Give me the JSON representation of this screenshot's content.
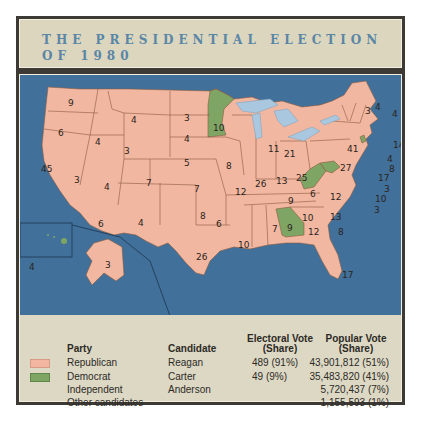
{
  "title": {
    "line1": "THE PRESIDENTIAL ELECTION",
    "line2": "OF 1980"
  },
  "colors": {
    "republican": "#f2b7a0",
    "democrat": "#7fa565",
    "ocean": "#41709a",
    "lakes": "#a9c7de",
    "title_text": "#5a86a6"
  },
  "map": {
    "states": [
      {
        "state": "WA",
        "ev": "9",
        "party": "Republican"
      },
      {
        "state": "OR",
        "ev": "6",
        "party": "Republican"
      },
      {
        "state": "CA",
        "ev": "45",
        "party": "Republican"
      },
      {
        "state": "ID",
        "ev": "4",
        "party": "Republican"
      },
      {
        "state": "NV",
        "ev": "3",
        "party": "Republican"
      },
      {
        "state": "MT",
        "ev": "4",
        "party": "Republican"
      },
      {
        "state": "WY",
        "ev": "3",
        "party": "Republican"
      },
      {
        "state": "UT",
        "ev": "4",
        "party": "Republican"
      },
      {
        "state": "AZ",
        "ev": "6",
        "party": "Republican"
      },
      {
        "state": "CO",
        "ev": "7",
        "party": "Republican"
      },
      {
        "state": "NM",
        "ev": "4",
        "party": "Republican"
      },
      {
        "state": "ND",
        "ev": "3",
        "party": "Republican"
      },
      {
        "state": "SD",
        "ev": "4",
        "party": "Republican"
      },
      {
        "state": "NE",
        "ev": "5",
        "party": "Republican"
      },
      {
        "state": "KS",
        "ev": "7",
        "party": "Republican"
      },
      {
        "state": "OK",
        "ev": "8",
        "party": "Republican"
      },
      {
        "state": "TX",
        "ev": "26",
        "party": "Republican"
      },
      {
        "state": "MN",
        "ev": "10",
        "party": "Democrat"
      },
      {
        "state": "IA",
        "ev": "8",
        "party": "Republican"
      },
      {
        "state": "MO",
        "ev": "12",
        "party": "Republican"
      },
      {
        "state": "AR",
        "ev": "6",
        "party": "Republican"
      },
      {
        "state": "LA",
        "ev": "10",
        "party": "Republican"
      },
      {
        "state": "WI",
        "ev": "11",
        "party": "Republican"
      },
      {
        "state": "IL",
        "ev": "26",
        "party": "Republican"
      },
      {
        "state": "MI",
        "ev": "21",
        "party": "Republican"
      },
      {
        "state": "IN",
        "ev": "13",
        "party": "Republican"
      },
      {
        "state": "OH",
        "ev": "25",
        "party": "Republican"
      },
      {
        "state": "KY",
        "ev": "9",
        "party": "Republican"
      },
      {
        "state": "TN",
        "ev": "10",
        "party": "Republican"
      },
      {
        "state": "MS",
        "ev": "7",
        "party": "Republican"
      },
      {
        "state": "AL",
        "ev": "9",
        "party": "Republican"
      },
      {
        "state": "GA",
        "ev": "12",
        "party": "Democrat"
      },
      {
        "state": "FL",
        "ev": "17",
        "party": "Republican"
      },
      {
        "state": "SC",
        "ev": "8",
        "party": "Republican"
      },
      {
        "state": "NC",
        "ev": "13",
        "party": "Republican"
      },
      {
        "state": "VA",
        "ev": "12",
        "party": "Republican"
      },
      {
        "state": "WV",
        "ev": "6",
        "party": "Democrat"
      },
      {
        "state": "PA",
        "ev": "27",
        "party": "Republican"
      },
      {
        "state": "NY",
        "ev": "41",
        "party": "Republican"
      },
      {
        "state": "VT",
        "ev": "3",
        "party": "Republican"
      },
      {
        "state": "NH",
        "ev": "4",
        "party": "Republican"
      },
      {
        "state": "ME",
        "ev": "4",
        "party": "Republican"
      },
      {
        "state": "MA",
        "ev": "14",
        "party": "Republican"
      },
      {
        "state": "RI",
        "ev": "4",
        "party": "Democrat"
      },
      {
        "state": "CT",
        "ev": "8",
        "party": "Republican"
      },
      {
        "state": "NJ",
        "ev": "17",
        "party": "Republican"
      },
      {
        "state": "DE",
        "ev": "3",
        "party": "Republican"
      },
      {
        "state": "MD",
        "ev": "10",
        "party": "Democrat"
      },
      {
        "state": "DC",
        "ev": "3",
        "party": "Democrat"
      },
      {
        "state": "AK",
        "ev": "3",
        "party": "Republican"
      },
      {
        "state": "HI",
        "ev": "4",
        "party": "Democrat"
      }
    ]
  },
  "legend": {
    "headers": {
      "party": "Party",
      "candidate": "Candidate",
      "electoral_line1": "Electoral Vote",
      "electoral_line2": "(Share)",
      "popular_line1": "Popular Vote",
      "popular_line2": "(Share)"
    },
    "rows": [
      {
        "party": "Republican",
        "candidate": "Reagan",
        "electoral": "489 (91%)",
        "popular": "43,901,812 (51%)",
        "swatch": "#f2b7a0"
      },
      {
        "party": "Democrat",
        "candidate": "Carter",
        "electoral": "49 (9%)",
        "popular": "35,483,820 (41%)",
        "swatch": "#7fa565"
      },
      {
        "party": "Independent",
        "candidate": "Anderson",
        "electoral": "",
        "popular": "5,720,437 (7%)",
        "swatch": ""
      },
      {
        "party": "Other candidates",
        "candidate": "",
        "electoral": "",
        "popular": "1,155,593 (1%)",
        "swatch": ""
      }
    ]
  }
}
